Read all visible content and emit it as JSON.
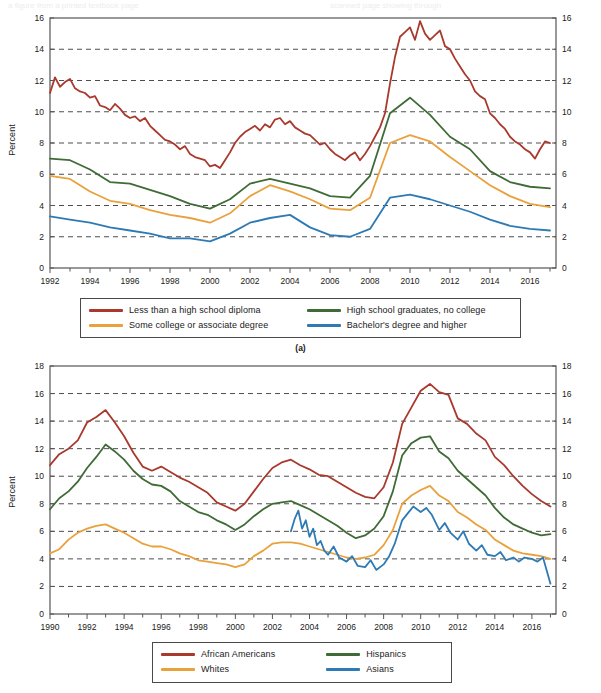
{
  "page": {
    "background": "#ffffff",
    "bleed_top_left": "a figure from a printed textbook page",
    "bleed_top_right": "scanned page showing through"
  },
  "palette": {
    "red": "#a8392c",
    "green": "#3f6b36",
    "orange": "#e9a13b",
    "blue": "#2e7ab5",
    "axis": "#555555",
    "grid": "#3a3a3a",
    "text": "#1a1a1a"
  },
  "panel_a": {
    "letter": "(a)",
    "ylabel": "Percent",
    "legend": [
      {
        "label": "Less than a high school diploma",
        "color": "#a8392c"
      },
      {
        "label": "High school graduates, no college",
        "color": "#3f6b36"
      },
      {
        "label": "Some college or associate degree",
        "color": "#e9a13b"
      },
      {
        "label": "Bachelor's degree and higher",
        "color": "#2e7ab5"
      }
    ]
  },
  "panel_b": {
    "letter": "",
    "ylabel": "Percent",
    "legend": [
      {
        "label": "African Americans",
        "color": "#a8392c"
      },
      {
        "label": "Hispanics",
        "color": "#3f6b36"
      },
      {
        "label": "Whites",
        "color": "#e9a13b"
      },
      {
        "label": "Asians",
        "color": "#2e7ab5"
      }
    ]
  },
  "chart_data": [
    {
      "type": "line",
      "id": "panel-a",
      "title": "",
      "xlabel": "",
      "ylabel": "Percent",
      "xlim": [
        1992,
        2017.3
      ],
      "ylim": [
        0,
        16
      ],
      "ytick_step": 2,
      "yticks": [
        0,
        2,
        4,
        6,
        8,
        10,
        12,
        14,
        16
      ],
      "xticks": [
        1992,
        1994,
        1996,
        1998,
        2000,
        2002,
        2004,
        2006,
        2008,
        2010,
        2012,
        2014,
        2016
      ],
      "xtick_minor_step": 1,
      "grid": "horizontal-dashed",
      "axis_labels_both_sides": true,
      "legend_position": "below",
      "series": [
        {
          "name": "Less than a high school diploma",
          "color": "#a8392c",
          "x": [
            1992,
            1992.25,
            1992.5,
            1992.75,
            1993,
            1993.25,
            1993.5,
            1993.75,
            1994,
            1994.25,
            1994.5,
            1994.75,
            1995,
            1995.25,
            1995.5,
            1995.75,
            1996,
            1996.25,
            1996.5,
            1996.75,
            1997,
            1997.25,
            1997.5,
            1997.75,
            1998,
            1998.25,
            1998.5,
            1998.75,
            1999,
            1999.25,
            1999.5,
            1999.75,
            2000,
            2000.25,
            2000.5,
            2000.75,
            2001,
            2001.25,
            2001.5,
            2001.75,
            2002,
            2002.25,
            2002.5,
            2002.75,
            2003,
            2003.25,
            2003.5,
            2003.75,
            2004,
            2004.25,
            2004.5,
            2004.75,
            2005,
            2005.25,
            2005.5,
            2005.75,
            2006,
            2006.25,
            2006.5,
            2006.75,
            2007,
            2007.25,
            2007.5,
            2007.75,
            2008,
            2008.25,
            2008.5,
            2008.75,
            2009,
            2009.25,
            2009.5,
            2009.75,
            2010,
            2010.25,
            2010.5,
            2010.75,
            2011,
            2011.25,
            2011.5,
            2011.75,
            2012,
            2012.25,
            2012.5,
            2012.75,
            2013,
            2013.25,
            2013.5,
            2013.75,
            2014,
            2014.25,
            2014.5,
            2014.75,
            2015,
            2015.25,
            2015.5,
            2015.75,
            2016,
            2016.25,
            2016.5,
            2016.75,
            2017
          ],
          "y": [
            11.2,
            12.2,
            11.6,
            11.9,
            12.1,
            11.5,
            11.3,
            11.2,
            10.9,
            11.0,
            10.4,
            10.3,
            10.1,
            10.5,
            10.2,
            9.8,
            9.6,
            9.7,
            9.4,
            9.6,
            9.1,
            8.8,
            8.5,
            8.2,
            8.1,
            7.9,
            7.6,
            7.8,
            7.3,
            7.1,
            7.0,
            6.9,
            6.5,
            6.6,
            6.4,
            6.9,
            7.4,
            8.0,
            8.4,
            8.7,
            8.9,
            9.1,
            8.8,
            9.2,
            9.0,
            9.5,
            9.6,
            9.2,
            9.4,
            9.0,
            8.8,
            8.6,
            8.5,
            8.2,
            7.9,
            8.0,
            7.6,
            7.3,
            7.1,
            6.9,
            7.2,
            7.4,
            6.9,
            7.3,
            7.8,
            8.4,
            9.0,
            9.9,
            11.8,
            13.5,
            14.8,
            15.1,
            15.4,
            14.6,
            15.8,
            15.0,
            14.6,
            14.9,
            15.2,
            14.2,
            14.0,
            13.4,
            12.9,
            12.4,
            12.0,
            11.3,
            11.0,
            10.8,
            9.9,
            9.6,
            9.2,
            8.9,
            8.4,
            8.1,
            7.9,
            7.6,
            7.4,
            7.0,
            7.6,
            8.1,
            8.0
          ]
        },
        {
          "name": "High school graduates, no college",
          "color": "#3f6b36",
          "x": [
            1992,
            1993,
            1994,
            1995,
            1996,
            1997,
            1998,
            1999,
            2000,
            2001,
            2002,
            2003,
            2004,
            2005,
            2006,
            2007,
            2008,
            2009,
            2010,
            2011,
            2012,
            2013,
            2014,
            2015,
            2016,
            2017
          ],
          "y": [
            7.0,
            6.9,
            6.3,
            5.5,
            5.4,
            5.0,
            4.6,
            4.1,
            3.8,
            4.4,
            5.4,
            5.7,
            5.4,
            5.1,
            4.6,
            4.5,
            5.9,
            9.9,
            10.9,
            9.8,
            8.4,
            7.6,
            6.2,
            5.5,
            5.2,
            5.1
          ]
        },
        {
          "name": "Some college or associate degree",
          "color": "#e9a13b",
          "x": [
            1992,
            1993,
            1994,
            1995,
            1996,
            1997,
            1998,
            1999,
            2000,
            2001,
            2002,
            2003,
            2004,
            2005,
            2006,
            2007,
            2008,
            2009,
            2010,
            2011,
            2012,
            2013,
            2014,
            2015,
            2016,
            2017
          ],
          "y": [
            5.9,
            5.7,
            4.9,
            4.3,
            4.1,
            3.7,
            3.4,
            3.2,
            2.9,
            3.5,
            4.6,
            5.3,
            4.9,
            4.4,
            3.8,
            3.7,
            4.5,
            8.0,
            8.5,
            8.1,
            7.1,
            6.2,
            5.3,
            4.6,
            4.1,
            3.9
          ]
        },
        {
          "name": "Bachelor's degree and higher",
          "color": "#2e7ab5",
          "x": [
            1992,
            1993,
            1994,
            1995,
            1996,
            1997,
            1998,
            1999,
            2000,
            2001,
            2002,
            2003,
            2004,
            2005,
            2006,
            2007,
            2008,
            2009,
            2010,
            2011,
            2012,
            2013,
            2014,
            2015,
            2016,
            2017
          ],
          "y": [
            3.3,
            3.1,
            2.9,
            2.6,
            2.4,
            2.2,
            1.9,
            1.9,
            1.7,
            2.2,
            2.9,
            3.2,
            3.4,
            2.6,
            2.1,
            2.0,
            2.5,
            4.5,
            4.7,
            4.4,
            4.0,
            3.6,
            3.1,
            2.7,
            2.5,
            2.4
          ]
        }
      ]
    },
    {
      "type": "line",
      "id": "panel-b",
      "title": "",
      "xlabel": "",
      "ylabel": "Percent",
      "xlim": [
        1990,
        2017.3
      ],
      "ylim": [
        0,
        18
      ],
      "ytick_step": 2,
      "yticks": [
        0,
        2,
        4,
        6,
        8,
        10,
        12,
        14,
        16,
        18
      ],
      "xticks": [
        1990,
        1992,
        1994,
        1996,
        1998,
        2000,
        2002,
        2004,
        2006,
        2008,
        2010,
        2012,
        2014,
        2016
      ],
      "xtick_minor_step": 1,
      "grid": "horizontal-dashed",
      "axis_labels_both_sides": true,
      "legend_position": "below",
      "series": [
        {
          "name": "African Americans",
          "color": "#a8392c",
          "x": [
            1990,
            1990.5,
            1991,
            1991.5,
            1992,
            1992.5,
            1993,
            1993.5,
            1994,
            1994.5,
            1995,
            1995.5,
            1996,
            1996.5,
            1997,
            1997.5,
            1998,
            1998.5,
            1999,
            1999.5,
            2000,
            2000.5,
            2001,
            2001.5,
            2002,
            2002.5,
            2003,
            2003.5,
            2004,
            2004.5,
            2005,
            2005.5,
            2006,
            2006.5,
            2007,
            2007.5,
            2008,
            2008.5,
            2009,
            2009.5,
            2010,
            2010.5,
            2011,
            2011.5,
            2012,
            2012.5,
            2013,
            2013.5,
            2014,
            2014.5,
            2015,
            2015.5,
            2016,
            2016.5,
            2017
          ],
          "y": [
            10.8,
            11.6,
            12.0,
            12.6,
            13.9,
            14.3,
            14.8,
            13.9,
            12.9,
            11.7,
            10.7,
            10.4,
            10.7,
            10.3,
            9.9,
            9.6,
            9.2,
            8.8,
            8.1,
            7.8,
            7.5,
            8.0,
            8.9,
            9.8,
            10.6,
            11.0,
            11.2,
            10.8,
            10.5,
            10.1,
            10.0,
            9.6,
            9.2,
            8.8,
            8.5,
            8.4,
            9.2,
            11.0,
            13.8,
            15.0,
            16.2,
            16.7,
            16.1,
            15.9,
            14.2,
            13.8,
            13.1,
            12.6,
            11.4,
            10.8,
            10.0,
            9.3,
            8.7,
            8.2,
            7.8
          ]
        },
        {
          "name": "Hispanics",
          "color": "#3f6b36",
          "x": [
            1990,
            1990.5,
            1991,
            1991.5,
            1992,
            1992.5,
            1993,
            1993.5,
            1994,
            1994.5,
            1995,
            1995.5,
            1996,
            1996.5,
            1997,
            1997.5,
            1998,
            1998.5,
            1999,
            1999.5,
            2000,
            2000.5,
            2001,
            2001.5,
            2002,
            2002.5,
            2003,
            2003.5,
            2004,
            2004.5,
            2005,
            2005.5,
            2006,
            2006.5,
            2007,
            2007.5,
            2008,
            2008.5,
            2009,
            2009.5,
            2010,
            2010.5,
            2011,
            2011.5,
            2012,
            2012.5,
            2013,
            2013.5,
            2014,
            2014.5,
            2015,
            2015.5,
            2016,
            2016.5,
            2017
          ],
          "y": [
            7.6,
            8.4,
            8.9,
            9.6,
            10.6,
            11.4,
            12.3,
            11.8,
            11.2,
            10.4,
            9.8,
            9.4,
            9.3,
            8.9,
            8.2,
            7.8,
            7.4,
            7.2,
            6.8,
            6.5,
            6.1,
            6.5,
            7.1,
            7.6,
            8.0,
            8.1,
            8.2,
            7.9,
            7.6,
            7.2,
            6.8,
            6.4,
            5.9,
            5.5,
            5.7,
            6.2,
            7.1,
            8.9,
            11.5,
            12.4,
            12.8,
            12.9,
            11.8,
            11.3,
            10.4,
            9.8,
            9.2,
            8.6,
            7.7,
            7.0,
            6.5,
            6.2,
            5.9,
            5.7,
            5.8
          ]
        },
        {
          "name": "Whites",
          "color": "#e9a13b",
          "x": [
            1990,
            1990.5,
            1991,
            1991.5,
            1992,
            1992.5,
            1993,
            1993.5,
            1994,
            1994.5,
            1995,
            1995.5,
            1996,
            1996.5,
            1997,
            1997.5,
            1998,
            1998.5,
            1999,
            1999.5,
            2000,
            2000.5,
            2001,
            2001.5,
            2002,
            2002.5,
            2003,
            2003.5,
            2004,
            2004.5,
            2005,
            2005.5,
            2006,
            2006.5,
            2007,
            2007.5,
            2008,
            2008.5,
            2009,
            2009.5,
            2010,
            2010.5,
            2011,
            2011.5,
            2012,
            2012.5,
            2013,
            2013.5,
            2014,
            2014.5,
            2015,
            2015.5,
            2016,
            2016.5,
            2017
          ],
          "y": [
            4.4,
            4.7,
            5.4,
            5.9,
            6.2,
            6.4,
            6.5,
            6.2,
            5.9,
            5.5,
            5.1,
            4.9,
            4.9,
            4.7,
            4.4,
            4.2,
            3.9,
            3.8,
            3.7,
            3.6,
            3.4,
            3.6,
            4.2,
            4.6,
            5.1,
            5.2,
            5.2,
            5.1,
            4.9,
            4.7,
            4.5,
            4.3,
            4.1,
            4.0,
            4.1,
            4.3,
            5.0,
            6.1,
            8.0,
            8.6,
            9.0,
            9.3,
            8.6,
            8.2,
            7.4,
            7.0,
            6.5,
            6.1,
            5.4,
            5.0,
            4.6,
            4.4,
            4.3,
            4.2,
            4.0
          ]
        },
        {
          "name": "Asians",
          "color": "#2e7ab5",
          "x": [
            2003,
            2003.2,
            2003.4,
            2003.6,
            2003.8,
            2004,
            2004.2,
            2004.4,
            2004.6,
            2004.8,
            2005,
            2005.3,
            2005.6,
            2006,
            2006.3,
            2006.6,
            2007,
            2007.3,
            2007.6,
            2008,
            2008.3,
            2008.6,
            2009,
            2009.3,
            2009.6,
            2010,
            2010.3,
            2010.6,
            2011,
            2011.3,
            2011.6,
            2012,
            2012.3,
            2012.6,
            2013,
            2013.3,
            2013.6,
            2014,
            2014.3,
            2014.6,
            2015,
            2015.3,
            2015.6,
            2016,
            2016.3,
            2016.6,
            2017
          ],
          "y": [
            6.0,
            6.9,
            7.5,
            6.2,
            6.8,
            5.6,
            6.2,
            5.0,
            5.3,
            4.6,
            4.3,
            4.9,
            4.1,
            3.8,
            4.2,
            3.5,
            3.4,
            3.9,
            3.2,
            3.6,
            4.2,
            5.1,
            6.8,
            7.3,
            7.8,
            7.4,
            7.7,
            7.2,
            6.1,
            6.6,
            5.9,
            5.4,
            6.0,
            5.1,
            4.6,
            5.0,
            4.3,
            4.2,
            4.5,
            3.9,
            4.1,
            3.8,
            4.1,
            4.0,
            3.8,
            4.1,
            2.2
          ]
        }
      ]
    }
  ]
}
